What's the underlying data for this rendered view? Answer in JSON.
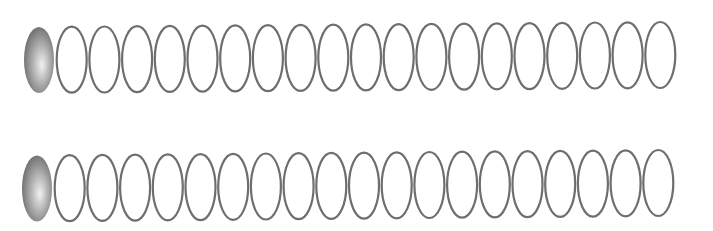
{
  "diagram": {
    "background": "#ffffff",
    "stroke_color": "#6e6e6e",
    "fill_gradient": {
      "highlight": "#f2f2f2",
      "mid": "#b4b4b4",
      "edge": "#6a6a6a"
    },
    "oval": {
      "rx": 15,
      "ry": 33,
      "stroke_width": 2.2,
      "pitch": 32.7
    },
    "rows": [
      {
        "name": "row-1",
        "count": 20,
        "filled_count": 1,
        "first_cx": 39,
        "first_cy": 60,
        "last_cy": 55
      },
      {
        "name": "row-2",
        "count": 20,
        "filled_count": 1,
        "first_cx": 37,
        "first_cy": 188.5,
        "last_cy": 183
      }
    ]
  }
}
